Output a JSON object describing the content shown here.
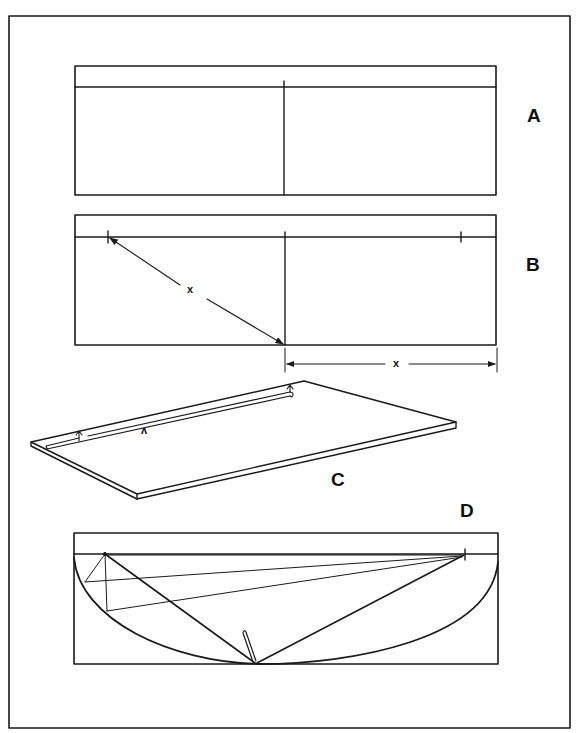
{
  "figure": {
    "colors": {
      "ink": "#1a1a1a",
      "paper": "#ffffff"
    },
    "panels": [
      {
        "id": "A",
        "label": "A",
        "description": "Board with straightedge along top, vertical centerline"
      },
      {
        "id": "B",
        "label": "B",
        "description": "Focus marks located by measuring distance x from centerline",
        "dimension_label": "x",
        "diagonal_label": "x"
      },
      {
        "id": "C",
        "label": "C",
        "description": "Board in perspective with groove/string along top edge",
        "groove_mark": "ʌ"
      },
      {
        "id": "D",
        "label": "D",
        "description": "Ellipse drawn with pencil and string between two foci"
      }
    ]
  }
}
